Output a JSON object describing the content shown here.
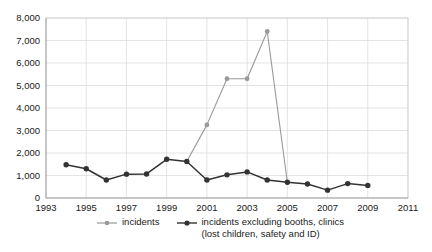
{
  "chart_data": {
    "type": "line",
    "title": "",
    "xlabel": "",
    "ylabel": "",
    "xlim": [
      1993,
      2011
    ],
    "ylim": [
      0,
      8000
    ],
    "grid": true,
    "legend_position": "bottom",
    "x_ticks": [
      "1993",
      "1995",
      "1997",
      "1999",
      "2001",
      "2003",
      "2005",
      "2007",
      "2009",
      "2011"
    ],
    "y_ticks": [
      "0",
      "1,000",
      "2,000",
      "3,000",
      "4,000",
      "5,000",
      "6,000",
      "7,000",
      "8,000"
    ],
    "series": [
      {
        "name": "incidents",
        "color": "#999999",
        "x": [
          2000,
          2001,
          2002,
          2003,
          2004,
          2005
        ],
        "values": [
          1620,
          3250,
          5300,
          5300,
          7400,
          700
        ]
      },
      {
        "name": "incidents excluding booths, clinics (lost children, safety and ID)",
        "color": "#333333",
        "x": [
          1994,
          1995,
          1996,
          1997,
          1998,
          1999,
          2000,
          2001,
          2002,
          2003,
          2004,
          2005,
          2006,
          2007,
          2008,
          2009
        ],
        "values": [
          1480,
          1300,
          800,
          1060,
          1070,
          1720,
          1620,
          800,
          1030,
          1160,
          800,
          700,
          620,
          350,
          640,
          560
        ]
      }
    ]
  },
  "legend": {
    "items": [
      {
        "label": "incidents",
        "label_line2": "",
        "color": "#999999"
      },
      {
        "label": "incidents excluding booths, clinics",
        "label_line2": "(lost children, safety and ID)",
        "color": "#333333"
      }
    ]
  }
}
